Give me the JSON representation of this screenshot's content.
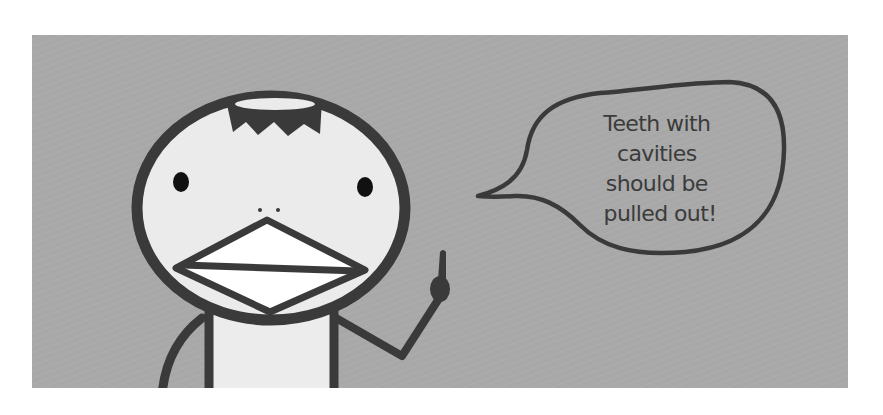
{
  "panel": {
    "background_color": "#a8a8a8",
    "line_color": "#3a3a3a",
    "face_color": "#ebebeb",
    "body_color": "#ececec"
  },
  "character": {
    "description": "stick-figure bird-like character with jagged hair, dot eyes, two nostril dots and a diamond beak, pointing finger raised"
  },
  "speech_bubble": {
    "lines": [
      "Teeth with",
      "cavities",
      "should be",
      "pulled out!"
    ]
  }
}
